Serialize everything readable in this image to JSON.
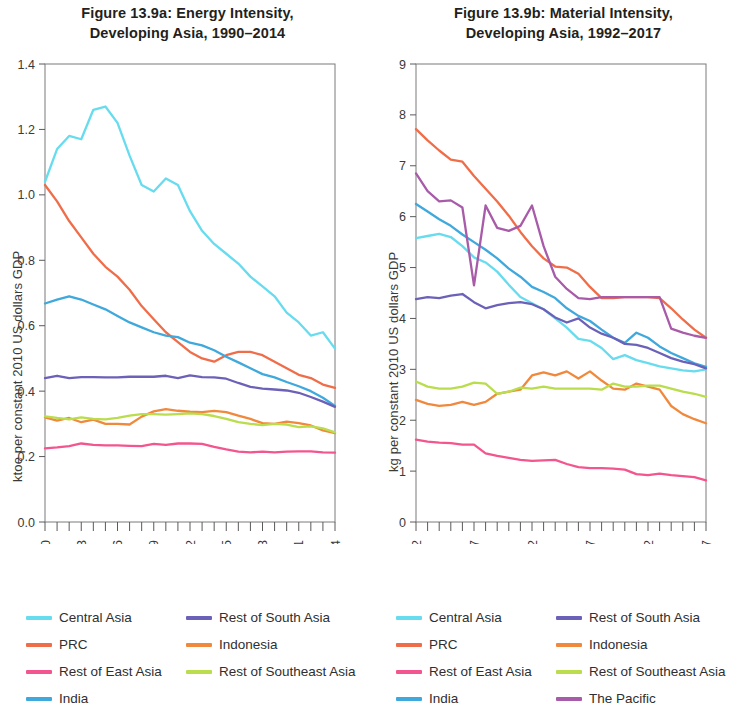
{
  "panels": [
    {
      "id": "energy-intensity",
      "title_line1": "Figure 13.9a: Energy Intensity,",
      "title_line2": "Developing Asia, 1990–2014"
    },
    {
      "id": "material-intensity",
      "title_line1": "Figure 13.9b: Material Intensity,",
      "title_line2": "Developing Asia, 1992–2017"
    }
  ],
  "colors": {
    "central_asia": "#67dcee",
    "prc": "#ef6d49",
    "rest_of_east_asia": "#f3558e",
    "india": "#3fa8dc",
    "rest_of_south_asia": "#6b61b8",
    "indonesia": "#f0893c",
    "rest_of_southeast_asia": "#b9dd4c",
    "the_pacific": "#a85ba8",
    "axis": "#5a5a5a"
  },
  "chart_data": [
    {
      "type": "line",
      "id": "energy-intensity",
      "title": "Figure 13.9a: Energy Intensity, Developing Asia, 1990–2014",
      "xlabel": "",
      "ylabel": "ktoe per constant 2010 US dollars GDP",
      "xlim": [
        1990,
        2014
      ],
      "ylim": [
        0.0,
        1.4
      ],
      "yticks": [
        0.0,
        0.2,
        0.4,
        0.6,
        0.8,
        1.0,
        1.2,
        1.4
      ],
      "ytick_labels": [
        "0.0",
        "0.2",
        "0.4",
        "0.6",
        "0.8",
        "1.0",
        "1.2",
        "1.4"
      ],
      "xticks_labeled": [
        1990,
        1993,
        1996,
        1999,
        2002,
        2005,
        2008,
        2011,
        2014
      ],
      "xtick_labels": [
        "1990",
        "1993",
        "1996",
        "1999",
        "2002",
        "2005",
        "2008",
        "2011",
        "2014"
      ],
      "minor_tick_every": 1,
      "grid": false,
      "legend_position": "below",
      "x": [
        1990,
        1991,
        1992,
        1993,
        1994,
        1995,
        1996,
        1997,
        1998,
        1999,
        2000,
        2001,
        2002,
        2003,
        2004,
        2005,
        2006,
        2007,
        2008,
        2009,
        2010,
        2011,
        2012,
        2013,
        2014
      ],
      "series": [
        {
          "name": "Central Asia",
          "color_key": "central_asia",
          "values": [
            1.04,
            1.14,
            1.18,
            1.17,
            1.26,
            1.27,
            1.22,
            1.12,
            1.03,
            1.01,
            1.05,
            1.03,
            0.95,
            0.89,
            0.85,
            0.82,
            0.79,
            0.75,
            0.72,
            0.69,
            0.64,
            0.61,
            0.57,
            0.58,
            0.53
          ]
        },
        {
          "name": "PRC",
          "color_key": "prc",
          "values": [
            1.03,
            0.98,
            0.92,
            0.87,
            0.82,
            0.78,
            0.75,
            0.71,
            0.66,
            0.62,
            0.58,
            0.55,
            0.52,
            0.5,
            0.49,
            0.51,
            0.52,
            0.52,
            0.51,
            0.49,
            0.47,
            0.45,
            0.44,
            0.42,
            0.41
          ]
        },
        {
          "name": "Rest of East Asia",
          "color_key": "rest_of_east_asia",
          "values": [
            0.225,
            0.228,
            0.232,
            0.24,
            0.236,
            0.234,
            0.234,
            0.233,
            0.232,
            0.239,
            0.236,
            0.24,
            0.24,
            0.239,
            0.23,
            0.222,
            0.215,
            0.213,
            0.215,
            0.213,
            0.215,
            0.216,
            0.216,
            0.213,
            0.212
          ]
        },
        {
          "name": "India",
          "color_key": "india",
          "values": [
            0.668,
            0.68,
            0.69,
            0.68,
            0.665,
            0.65,
            0.63,
            0.61,
            0.595,
            0.58,
            0.57,
            0.565,
            0.548,
            0.54,
            0.525,
            0.505,
            0.488,
            0.47,
            0.452,
            0.442,
            0.428,
            0.415,
            0.4,
            0.38,
            0.355
          ]
        },
        {
          "name": "Rest of South Asia",
          "color_key": "rest_of_south_asia",
          "values": [
            0.44,
            0.447,
            0.44,
            0.443,
            0.443,
            0.442,
            0.442,
            0.444,
            0.444,
            0.444,
            0.447,
            0.44,
            0.448,
            0.443,
            0.442,
            0.438,
            0.425,
            0.413,
            0.408,
            0.405,
            0.402,
            0.395,
            0.382,
            0.368,
            0.352
          ]
        },
        {
          "name": "Indonesia",
          "color_key": "indonesia",
          "values": [
            0.32,
            0.31,
            0.318,
            0.305,
            0.313,
            0.3,
            0.3,
            0.298,
            0.322,
            0.338,
            0.345,
            0.34,
            0.337,
            0.336,
            0.34,
            0.336,
            0.325,
            0.315,
            0.302,
            0.3,
            0.307,
            0.302,
            0.295,
            0.28,
            0.272
          ]
        },
        {
          "name": "Rest of Southeast Asia",
          "color_key": "rest_of_southeast_asia",
          "values": [
            0.323,
            0.318,
            0.314,
            0.32,
            0.315,
            0.314,
            0.318,
            0.325,
            0.33,
            0.33,
            0.328,
            0.33,
            0.332,
            0.33,
            0.324,
            0.315,
            0.305,
            0.3,
            0.296,
            0.3,
            0.298,
            0.29,
            0.292,
            0.286,
            0.274
          ]
        }
      ]
    },
    {
      "type": "line",
      "id": "material-intensity",
      "title": "Figure 13.9b: Material Intensity, Developing Asia, 1992–2017",
      "xlabel": "",
      "ylabel": "kg per constant 2010 US dollars GDP",
      "xlim": [
        1992,
        2017
      ],
      "ylim": [
        0,
        9
      ],
      "yticks": [
        0,
        1,
        2,
        3,
        4,
        5,
        6,
        7,
        8,
        9
      ],
      "ytick_labels": [
        "0",
        "1",
        "2",
        "3",
        "4",
        "5",
        "6",
        "7",
        "8",
        "9"
      ],
      "xticks_labeled": [
        1992,
        1997,
        2002,
        2007,
        2012,
        2017
      ],
      "xtick_labels": [
        "1992",
        "1997",
        "2002",
        "2007",
        "2012",
        "2017"
      ],
      "minor_tick_every": 1,
      "grid": false,
      "legend_position": "below",
      "x": [
        1992,
        1993,
        1994,
        1995,
        1996,
        1997,
        1998,
        1999,
        2000,
        2001,
        2002,
        2003,
        2004,
        2005,
        2006,
        2007,
        2008,
        2009,
        2010,
        2011,
        2012,
        2013,
        2014,
        2015,
        2016,
        2017
      ],
      "series": [
        {
          "name": "Central Asia",
          "color_key": "central_asia",
          "values": [
            5.58,
            5.62,
            5.66,
            5.6,
            5.42,
            5.2,
            5.1,
            4.92,
            4.66,
            4.42,
            4.3,
            4.18,
            4.0,
            3.82,
            3.6,
            3.56,
            3.42,
            3.2,
            3.28,
            3.18,
            3.12,
            3.06,
            3.02,
            2.98,
            2.96,
            3.0
          ]
        },
        {
          "name": "PRC",
          "color_key": "prc",
          "values": [
            7.72,
            7.5,
            7.3,
            7.12,
            7.08,
            6.8,
            6.55,
            6.3,
            6.02,
            5.7,
            5.42,
            5.18,
            5.02,
            5.0,
            4.88,
            4.62,
            4.4,
            4.4,
            4.42,
            4.42,
            4.42,
            4.4,
            4.2,
            3.98,
            3.78,
            3.62
          ]
        },
        {
          "name": "Rest of East Asia",
          "color_key": "rest_of_east_asia",
          "values": [
            1.62,
            1.58,
            1.56,
            1.55,
            1.52,
            1.52,
            1.35,
            1.3,
            1.26,
            1.22,
            1.2,
            1.21,
            1.22,
            1.14,
            1.08,
            1.06,
            1.06,
            1.05,
            1.03,
            0.94,
            0.92,
            0.95,
            0.92,
            0.9,
            0.88,
            0.82
          ]
        },
        {
          "name": "India",
          "color_key": "india",
          "values": [
            6.25,
            6.1,
            5.95,
            5.82,
            5.65,
            5.5,
            5.35,
            5.18,
            4.98,
            4.82,
            4.62,
            4.52,
            4.4,
            4.2,
            4.05,
            3.95,
            3.78,
            3.62,
            3.52,
            3.72,
            3.62,
            3.45,
            3.32,
            3.22,
            3.12,
            3.05
          ]
        },
        {
          "name": "Rest of South Asia",
          "color_key": "rest_of_south_asia",
          "values": [
            4.38,
            4.42,
            4.4,
            4.45,
            4.48,
            4.32,
            4.2,
            4.26,
            4.3,
            4.32,
            4.28,
            4.18,
            4.02,
            3.92,
            4.0,
            3.82,
            3.7,
            3.62,
            3.5,
            3.48,
            3.42,
            3.32,
            3.22,
            3.15,
            3.1,
            3.02
          ]
        },
        {
          "name": "Indonesia",
          "color_key": "indonesia",
          "values": [
            2.4,
            2.32,
            2.28,
            2.3,
            2.36,
            2.3,
            2.36,
            2.52,
            2.56,
            2.6,
            2.88,
            2.94,
            2.88,
            2.96,
            2.82,
            2.96,
            2.78,
            2.62,
            2.6,
            2.72,
            2.66,
            2.6,
            2.28,
            2.12,
            2.02,
            1.94
          ]
        },
        {
          "name": "Rest of Southeast Asia",
          "color_key": "rest_of_southeast_asia",
          "values": [
            2.76,
            2.66,
            2.62,
            2.62,
            2.66,
            2.74,
            2.72,
            2.52,
            2.56,
            2.64,
            2.62,
            2.66,
            2.62,
            2.62,
            2.62,
            2.62,
            2.6,
            2.72,
            2.66,
            2.66,
            2.68,
            2.68,
            2.62,
            2.56,
            2.52,
            2.46
          ]
        },
        {
          "name": "The Pacific",
          "color_key": "the_pacific",
          "values": [
            6.85,
            6.5,
            6.3,
            6.32,
            6.18,
            4.65,
            6.22,
            5.78,
            5.72,
            5.82,
            6.22,
            5.42,
            4.82,
            4.58,
            4.4,
            4.38,
            4.42,
            4.42,
            4.42,
            4.42,
            4.42,
            4.42,
            3.8,
            3.72,
            3.66,
            3.62
          ]
        }
      ]
    }
  ],
  "legends": [
    {
      "panel": "energy-intensity",
      "items": [
        {
          "label": "Central Asia",
          "color_key": "central_asia"
        },
        {
          "label": "Rest of South Asia",
          "color_key": "rest_of_south_asia"
        },
        {
          "label": "PRC",
          "color_key": "prc"
        },
        {
          "label": "Indonesia",
          "color_key": "indonesia"
        },
        {
          "label": "Rest of East Asia",
          "color_key": "rest_of_east_asia"
        },
        {
          "label": "Rest of Southeast Asia",
          "color_key": "rest_of_southeast_asia"
        },
        {
          "label": "India",
          "color_key": "india"
        },
        {
          "label": "",
          "color_key": ""
        }
      ]
    },
    {
      "panel": "material-intensity",
      "items": [
        {
          "label": "Central Asia",
          "color_key": "central_asia"
        },
        {
          "label": "Rest of South Asia",
          "color_key": "rest_of_south_asia"
        },
        {
          "label": "PRC",
          "color_key": "prc"
        },
        {
          "label": "Indonesia",
          "color_key": "indonesia"
        },
        {
          "label": "Rest of East Asia",
          "color_key": "rest_of_east_asia"
        },
        {
          "label": "Rest of Southeast Asia",
          "color_key": "rest_of_southeast_asia"
        },
        {
          "label": "India",
          "color_key": "india"
        },
        {
          "label": "The Pacific",
          "color_key": "the_pacific"
        }
      ]
    }
  ]
}
